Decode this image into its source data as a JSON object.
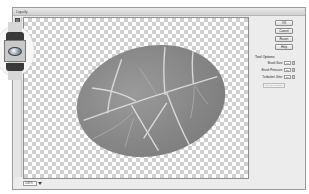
{
  "window": {
    "title": "Liquify"
  },
  "buttons": [
    {
      "label": "OK"
    },
    {
      "label": "Cancel"
    },
    {
      "label": "Revert"
    },
    {
      "label": "Help"
    }
  ],
  "tool_options": {
    "title": "Tool Options",
    "fields": [
      {
        "label": "Brush Size:",
        "value": "64"
      },
      {
        "label": "Brush Pressure:",
        "value": "50"
      },
      {
        "label": "Turbulent Jitter:",
        "value": "50"
      }
    ],
    "disabled_button": "Stylus Pressure"
  },
  "zoom": {
    "value": "100%"
  },
  "callout": {
    "tool_icon": "bloat-tool-icon"
  },
  "canvas": {
    "content": "leaf-texture-ellipse",
    "background": "transparency-checkerboard"
  },
  "colors": {
    "dialog_bg": "#ececec",
    "checker_dark": "#cfcfcf",
    "leaf": "#858585"
  }
}
